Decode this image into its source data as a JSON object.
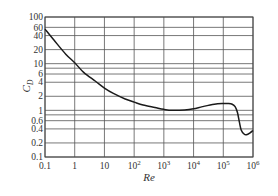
{
  "chart_data": {
    "type": "line",
    "title": "",
    "xlabel": "Re",
    "ylabel": "C_D",
    "xscale": "log",
    "yscale": "log",
    "xlim": [
      0.1,
      1000000
    ],
    "ylim": [
      0.1,
      100
    ],
    "grid": true,
    "legend": null,
    "x_ticks": [
      {
        "value": 0.1,
        "label": "0.1",
        "sup": ""
      },
      {
        "value": 1,
        "label": "1",
        "sup": ""
      },
      {
        "value": 10,
        "label": "10",
        "sup": ""
      },
      {
        "value": 100,
        "label": "10",
        "sup": "2"
      },
      {
        "value": 1000,
        "label": "10",
        "sup": "3"
      },
      {
        "value": 10000,
        "label": "10",
        "sup": "4"
      },
      {
        "value": 100000,
        "label": "10",
        "sup": "5"
      },
      {
        "value": 1000000,
        "label": "10",
        "sup": "6"
      }
    ],
    "y_ticks": [
      {
        "value": 100,
        "label": "100"
      },
      {
        "value": 60,
        "label": "60"
      },
      {
        "value": 40,
        "label": "40"
      },
      {
        "value": 20,
        "label": "20"
      },
      {
        "value": 10,
        "label": "10"
      },
      {
        "value": 8,
        "label": ""
      },
      {
        "value": 6,
        "label": "6"
      },
      {
        "value": 4,
        "label": "4"
      },
      {
        "value": 2,
        "label": "2"
      },
      {
        "value": 1,
        "label": "1"
      },
      {
        "value": 0.8,
        "label": ""
      },
      {
        "value": 0.6,
        "label": "0.6"
      },
      {
        "value": 0.4,
        "label": "0.4"
      },
      {
        "value": 0.2,
        "label": "0.2"
      },
      {
        "value": 0.1,
        "label": "0.1"
      }
    ],
    "series": [
      {
        "name": "Drag coefficient of a sphere",
        "x": [
          0.1,
          0.2,
          0.5,
          1,
          2,
          5,
          10,
          20,
          50,
          100,
          200,
          500,
          1000,
          2000,
          5000,
          10000,
          20000,
          50000,
          100000,
          150000,
          200000,
          250000,
          300000,
          350000,
          400000,
          500000,
          600000,
          800000,
          1000000
        ],
        "y": [
          55,
          32,
          16,
          10.5,
          6.5,
          4.2,
          3.0,
          2.3,
          1.75,
          1.5,
          1.3,
          1.15,
          1.05,
          1.0,
          1.02,
          1.08,
          1.2,
          1.35,
          1.4,
          1.4,
          1.35,
          1.2,
          0.9,
          0.55,
          0.38,
          0.31,
          0.3,
          0.33,
          0.37
        ]
      }
    ]
  }
}
